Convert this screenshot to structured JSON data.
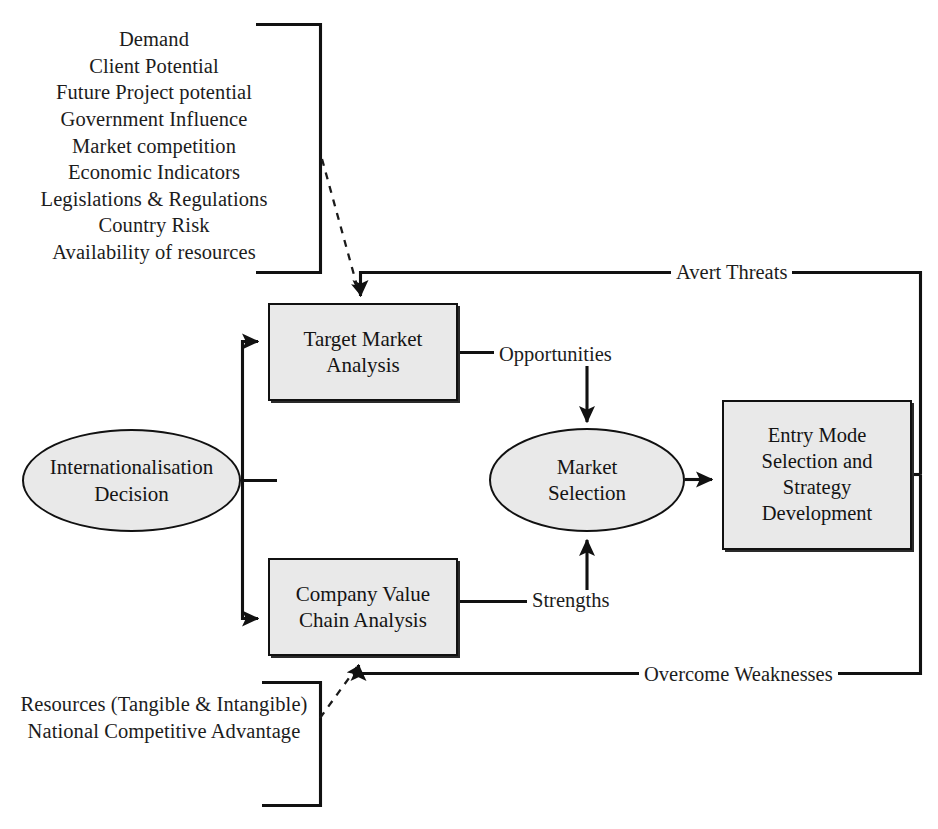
{
  "diagram": {
    "colors": {
      "node_fill": "#e9e9e9",
      "stroke": "#111111",
      "text": "#1a1a1a",
      "background": "#ffffff"
    },
    "lists": [
      {
        "id": "external-factors",
        "text": "Demand\nClient Potential\nFuture Project potential\nGovernment Influence\nMarket competition\nEconomic Indicators\nLegislations & Regulations\nCountry Risk\nAvailability of resources",
        "items": [
          "Demand",
          "Client Potential",
          "Future Project potential",
          "Government Influence",
          "Market competition",
          "Economic Indicators",
          "Legislations & Regulations",
          "Country Risk",
          "Availability of resources"
        ]
      },
      {
        "id": "internal-factors",
        "text": "Resources (Tangible & Intangible)\nNational Competitive Advantage",
        "items": [
          "Resources (Tangible & Intangible)",
          "National Competitive Advantage"
        ]
      }
    ],
    "nodes": {
      "intl_decision": {
        "label": "Internationalisation\nDecision",
        "shape": "ellipse"
      },
      "target_market": {
        "label": "Target Market\nAnalysis",
        "shape": "rectangle"
      },
      "company_value": {
        "label": "Company Value\nChain Analysis",
        "shape": "rectangle"
      },
      "market_selection": {
        "label": "Market\nSelection",
        "shape": "ellipse"
      },
      "entry_mode": {
        "label": "Entry Mode\nSelection and\nStrategy\nDevelopment",
        "shape": "rectangle"
      }
    },
    "edge_labels": {
      "opportunities": "Opportunities",
      "strengths": "Strengths",
      "avert_threats": "Avert Threats",
      "overcome_weaknesses": "Overcome Weaknesses"
    }
  }
}
